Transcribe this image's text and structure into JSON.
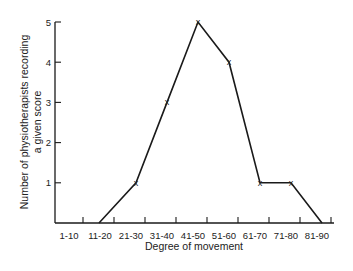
{
  "chart_data": {
    "type": "line",
    "title": "",
    "xlabel": "Degree of movement",
    "ylabel_lines": [
      "Number of physiotherapists recording",
      "a given score"
    ],
    "ylabel": "Number of physiotherapists recording a given score",
    "categories": [
      "1-10",
      "11-20",
      "21-30",
      "31-40",
      "41-50",
      "51-60",
      "61-70",
      "71-80",
      "81-90"
    ],
    "y_ticks": [
      1,
      2,
      3,
      4,
      5
    ],
    "ylim": [
      0,
      5
    ],
    "grid": false,
    "legend": null,
    "series": [
      {
        "name": "Frequency",
        "marker": "x",
        "points": [
          {
            "category": "11-20",
            "value": 0,
            "marker": false
          },
          {
            "category": "21-30",
            "value": 1,
            "marker": true
          },
          {
            "category": "31-40",
            "value": 3,
            "marker": true
          },
          {
            "category": "41-50",
            "value": 5,
            "marker": true
          },
          {
            "category": "51-60",
            "value": 4,
            "marker": true
          },
          {
            "category": "61-70",
            "value": 1,
            "marker": true
          },
          {
            "category": "71-80",
            "value": 1,
            "marker": true
          },
          {
            "category": "81-90",
            "value": 0,
            "marker": false
          }
        ]
      }
    ],
    "colors": {
      "line": "#1a1a1a",
      "axis": "#1a1a1a",
      "background": "#ffffff"
    }
  }
}
